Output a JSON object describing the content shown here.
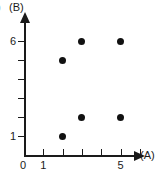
{
  "chart_data": {
    "type": "scatter",
    "title": "",
    "xlabel": "(A)",
    "ylabel": "(B)",
    "xlim": [
      0,
      7
    ],
    "ylim": [
      0,
      7
    ],
    "grid": false,
    "legend": null,
    "origin_label": "0",
    "x_ticks": [
      1,
      2,
      3,
      4,
      5,
      6
    ],
    "x_tick_labels": [
      "1",
      "",
      "",
      "",
      "5",
      ""
    ],
    "y_ticks": [
      1,
      2,
      3,
      4,
      5,
      6
    ],
    "y_tick_labels": [
      "1",
      "",
      "",
      "",
      "",
      "6"
    ],
    "points": [
      {
        "x": 2,
        "y": 5
      },
      {
        "x": 3,
        "y": 6
      },
      {
        "x": 5,
        "y": 6
      },
      {
        "x": 2,
        "y": 1
      },
      {
        "x": 3,
        "y": 2
      },
      {
        "x": 5,
        "y": 2
      }
    ],
    "marker": "filled-circle",
    "marker_color": "#111111",
    "axis_color": "#1a1a1a",
    "background_color": "#ffffff"
  },
  "labels": {
    "y_axis_title": "(B)",
    "y_axis_title_partial": ")",
    "x_axis_title": "(A)",
    "origin": "0",
    "y_top": "6",
    "y_bottom": "1",
    "x_first": "1",
    "x_fifth": "5"
  }
}
